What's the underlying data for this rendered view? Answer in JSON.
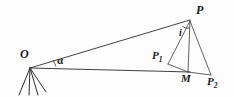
{
  "figure": {
    "background_color": "#fdfdfd",
    "line_color": "#2b2b2b",
    "width": 234,
    "height": 98
  },
  "labels": {
    "P": "P",
    "O": "O",
    "M": "M",
    "i": "i",
    "alpha": "α",
    "P1_base": "P",
    "P1_sub": "1",
    "P2_base": "P",
    "P2_sub": "2"
  },
  "points": {
    "O": {
      "x": 30,
      "y": 68,
      "label": "O"
    },
    "P": {
      "x": 190,
      "y": 20,
      "label": "P"
    },
    "M": {
      "x": 188,
      "y": 72,
      "label": "M"
    },
    "P1": {
      "x": 168,
      "y": 64,
      "label": "P1"
    },
    "P2": {
      "x": 211,
      "y": 75,
      "label": "P2"
    }
  },
  "segments": [
    {
      "name": "O-P",
      "from": "O",
      "to": "P"
    },
    {
      "name": "O-M",
      "from": "O",
      "to": "M"
    },
    {
      "name": "P-M",
      "from": "P",
      "to": "M"
    },
    {
      "name": "P-P1",
      "from": "P",
      "to": "P1"
    },
    {
      "name": "P-P2",
      "from": "P",
      "to": "P2"
    },
    {
      "name": "P1-M",
      "from": "P1",
      "to": "M"
    },
    {
      "name": "M-P2",
      "from": "M",
      "to": "P2"
    }
  ],
  "angles": [
    {
      "name": "alpha",
      "vertex": "O",
      "symbol": "α"
    },
    {
      "name": "i",
      "vertex": "P",
      "symbol": "i"
    }
  ],
  "instrument": {
    "name": "tripod",
    "at": "O",
    "leg_count": 4
  }
}
